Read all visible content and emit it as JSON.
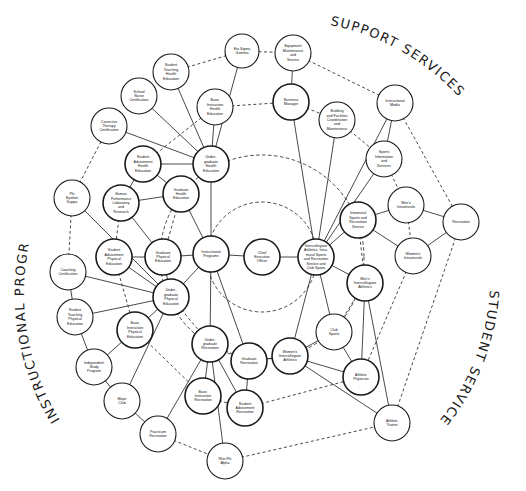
{
  "section_titles": {
    "support": "SUPPORT SERVICES",
    "instructional": "INSTRUCTIONAL PROGRAMS",
    "student": "STUDENT SERVICES"
  },
  "nodes": [
    {
      "id": "eta",
      "label": [
        "Eta Sigma",
        "Gamma"
      ],
      "x": 242,
      "y": 51,
      "r": 17
    },
    {
      "id": "equip",
      "label": [
        "Equipment",
        "Maintenance",
        "and",
        "Service"
      ],
      "x": 293,
      "y": 53,
      "r": 18
    },
    {
      "id": "stHealth",
      "label": [
        "Student",
        "Teaching",
        "Health",
        "Education"
      ],
      "x": 171,
      "y": 72,
      "r": 18
    },
    {
      "id": "nurse",
      "label": [
        "School",
        "Nurse",
        "Certification"
      ],
      "x": 139,
      "y": 96,
      "r": 18
    },
    {
      "id": "biHealth",
      "label": [
        "Basic",
        "Instruction",
        "Health",
        "Education"
      ],
      "x": 215,
      "y": 107,
      "r": 18
    },
    {
      "id": "business",
      "label": [
        "Business",
        "Manager"
      ],
      "x": 291,
      "y": 102,
      "r": 18,
      "bold": true
    },
    {
      "id": "building",
      "label": [
        "Building",
        "and Facilities",
        "Coordination",
        "and",
        "Maintenance"
      ],
      "x": 337,
      "y": 120,
      "r": 18
    },
    {
      "id": "media",
      "label": [
        "Instructional",
        "Media"
      ],
      "x": 395,
      "y": 103,
      "r": 18
    },
    {
      "id": "corrective",
      "label": [
        "Corrective",
        "Therapy",
        "Certification"
      ],
      "x": 109,
      "y": 126,
      "r": 18
    },
    {
      "id": "saHealth",
      "label": [
        "Student",
        "Advisement",
        "Health",
        "Education"
      ],
      "x": 143,
      "y": 164,
      "r": 18,
      "bold": true
    },
    {
      "id": "ugHealth",
      "label": [
        "Under-",
        "graduate",
        "Health",
        "Education"
      ],
      "x": 211,
      "y": 164,
      "r": 18,
      "bold": true
    },
    {
      "id": "sportsInfo",
      "label": [
        "Sports",
        "Information",
        "and",
        "Services"
      ],
      "x": 384,
      "y": 159,
      "r": 18
    },
    {
      "id": "gHealth",
      "label": [
        "Graduate",
        "Health",
        "Education"
      ],
      "x": 181,
      "y": 194,
      "r": 18,
      "bold": true
    },
    {
      "id": "hpl",
      "label": [
        "Human",
        "Performance",
        "Laboratory",
        "and",
        "Research"
      ],
      "x": 121,
      "y": 203,
      "r": 18,
      "bold": true
    },
    {
      "id": "phi",
      "label": [
        "Phi",
        "Epsilon",
        "Kappa"
      ],
      "x": 72,
      "y": 198,
      "r": 18
    },
    {
      "id": "mIntra",
      "label": [
        "Men's",
        "Intramurals"
      ],
      "x": 406,
      "y": 205,
      "r": 18
    },
    {
      "id": "recreation",
      "label": [
        "Recreation"
      ],
      "x": 461,
      "y": 222,
      "r": 18
    },
    {
      "id": "intramural",
      "label": [
        "Intramural",
        "Sports and",
        "Recreation",
        "Service"
      ],
      "x": 358,
      "y": 220,
      "r": 18,
      "bold": true
    },
    {
      "id": "saPE",
      "label": [
        "Student",
        "Advisement",
        "Physical",
        "Education"
      ],
      "x": 114,
      "y": 257,
      "r": 18,
      "bold": true
    },
    {
      "id": "gPE",
      "label": [
        "Graduate",
        "Physical",
        "Education"
      ],
      "x": 163,
      "y": 257,
      "r": 18,
      "bold": true
    },
    {
      "id": "instr",
      "label": [
        "Instructional",
        "Programs"
      ],
      "x": 211,
      "y": 254,
      "r": 18,
      "bold": true
    },
    {
      "id": "ceo",
      "label": [
        "Chief",
        "Executive",
        "Officer"
      ],
      "x": 262,
      "y": 257,
      "r": 18,
      "bold": true
    },
    {
      "id": "interAth",
      "label": [
        "Intercollegiate",
        "Athletics, Intra-",
        "mural Sports",
        "and Recreation",
        "Service and",
        "Club Sports"
      ],
      "x": 316,
      "y": 257,
      "r": 18,
      "bold": true
    },
    {
      "id": "wIntra",
      "label": [
        "Women's",
        "Intramurals"
      ],
      "x": 413,
      "y": 256,
      "r": 18
    },
    {
      "id": "coaching",
      "label": [
        "Coaching",
        "Certification"
      ],
      "x": 68,
      "y": 272,
      "r": 18
    },
    {
      "id": "ugPE",
      "label": [
        "Under-",
        "graduate",
        "Physical",
        "Education"
      ],
      "x": 171,
      "y": 297,
      "r": 18,
      "bold": true
    },
    {
      "id": "mInter",
      "label": [
        "Men's",
        "Intercollegiate",
        "Athletics"
      ],
      "x": 365,
      "y": 283,
      "r": 18,
      "bold": true
    },
    {
      "id": "stPE",
      "label": [
        "Student",
        "Teaching",
        "Physical",
        "Education"
      ],
      "x": 75,
      "y": 317,
      "r": 18
    },
    {
      "id": "biPE",
      "label": [
        "Basic",
        "Instruction",
        "Physical",
        "Education"
      ],
      "x": 135,
      "y": 330,
      "r": 18,
      "bold": true
    },
    {
      "id": "club",
      "label": [
        "Club",
        "Sports"
      ],
      "x": 334,
      "y": 332,
      "r": 18
    },
    {
      "id": "ugRec",
      "label": [
        "Under-",
        "graduate",
        "Recreation"
      ],
      "x": 210,
      "y": 344,
      "r": 18,
      "bold": true
    },
    {
      "id": "gRec",
      "label": [
        "Graduate",
        "Recreation"
      ],
      "x": 249,
      "y": 361,
      "r": 18,
      "bold": true
    },
    {
      "id": "wInter",
      "label": [
        "Women's",
        "Intercollegiate",
        "Athletics"
      ],
      "x": 290,
      "y": 356,
      "r": 18,
      "bold": true
    },
    {
      "id": "indep",
      "label": [
        "Independent",
        "Study",
        "Program"
      ],
      "x": 94,
      "y": 367,
      "r": 18
    },
    {
      "id": "physician",
      "label": [
        "Athletic",
        "Physician"
      ],
      "x": 361,
      "y": 377,
      "r": 18,
      "bold": true
    },
    {
      "id": "biRec",
      "label": [
        "Basic",
        "Instruction",
        "Recreation"
      ],
      "x": 203,
      "y": 396,
      "r": 18,
      "bold": true
    },
    {
      "id": "saRec",
      "label": [
        "Student",
        "Advisement",
        "Recreation"
      ],
      "x": 245,
      "y": 408,
      "r": 18,
      "bold": true
    },
    {
      "id": "major",
      "label": [
        "Major",
        "Club"
      ],
      "x": 122,
      "y": 401,
      "r": 18
    },
    {
      "id": "trainer",
      "label": [
        "Athletic",
        "Trainer"
      ],
      "x": 392,
      "y": 423,
      "r": 18
    },
    {
      "id": "practicum",
      "label": [
        "Practicum",
        "Recreation"
      ],
      "x": 158,
      "y": 434,
      "r": 18
    },
    {
      "id": "rho",
      "label": [
        "Rho Phi",
        "Alpha"
      ],
      "x": 225,
      "y": 461,
      "r": 18
    }
  ],
  "edges": [
    [
      "ceo",
      "instr",
      "solid"
    ],
    [
      "ceo",
      "interAth",
      "solid"
    ],
    [
      "instr",
      "ugHealth",
      "solid"
    ],
    [
      "instr",
      "gPE",
      "solid"
    ],
    [
      "instr",
      "ugPE",
      "solid"
    ],
    [
      "instr",
      "ugRec",
      "solid"
    ],
    [
      "instr",
      "gHealth",
      "solid"
    ],
    [
      "instr",
      "gRec",
      "solid"
    ],
    [
      "ugHealth",
      "eta",
      "solid"
    ],
    [
      "ugHealth",
      "stHealth",
      "solid"
    ],
    [
      "ugHealth",
      "nurse",
      "solid"
    ],
    [
      "ugHealth",
      "biHealth",
      "solid"
    ],
    [
      "ugHealth",
      "corrective",
      "solid"
    ],
    [
      "ugHealth",
      "saHealth",
      "solid"
    ],
    [
      "saHealth",
      "gHealth",
      "solid"
    ],
    [
      "saHealth",
      "hpl",
      "solid"
    ],
    [
      "gHealth",
      "hpl",
      "solid"
    ],
    [
      "hpl",
      "gPE",
      "solid"
    ],
    [
      "phi",
      "ugPE",
      "solid"
    ],
    [
      "saPE",
      "gPE",
      "solid"
    ],
    [
      "saPE",
      "ugPE",
      "solid"
    ],
    [
      "gPE",
      "ugPE",
      "solid"
    ],
    [
      "coaching",
      "ugPE",
      "solid"
    ],
    [
      "stPE",
      "ugPE",
      "solid"
    ],
    [
      "biPE",
      "ugPE",
      "solid"
    ],
    [
      "major",
      "ugPE",
      "solid"
    ],
    [
      "coaching",
      "stPE",
      "solid"
    ],
    [
      "stPE",
      "indep",
      "solid"
    ],
    [
      "indep",
      "biPE",
      "solid"
    ],
    [
      "indep",
      "major",
      "solid"
    ],
    [
      "major",
      "practicum",
      "solid"
    ],
    [
      "ugRec",
      "gRec",
      "dashed"
    ],
    [
      "ugRec",
      "biRec",
      "solid"
    ],
    [
      "ugRec",
      "saRec",
      "solid"
    ],
    [
      "ugRec",
      "practicum",
      "solid"
    ],
    [
      "ugRec",
      "rho",
      "solid"
    ],
    [
      "gRec",
      "saRec",
      "solid"
    ],
    [
      "equip",
      "business",
      "solid"
    ],
    [
      "business",
      "interAth",
      "solid"
    ],
    [
      "building",
      "interAth",
      "solid"
    ],
    [
      "media",
      "interAth",
      "solid"
    ],
    [
      "media",
      "sportsInfo",
      "solid"
    ],
    [
      "sportsInfo",
      "interAth",
      "solid"
    ],
    [
      "interAth",
      "intramural",
      "solid"
    ],
    [
      "interAth",
      "mInter",
      "solid"
    ],
    [
      "interAth",
      "wInter",
      "solid"
    ],
    [
      "interAth",
      "club",
      "solid"
    ],
    [
      "intramural",
      "mIntra",
      "solid"
    ],
    [
      "intramural",
      "wIntra",
      "solid"
    ],
    [
      "mIntra",
      "recreation",
      "solid"
    ],
    [
      "wIntra",
      "recreation",
      "solid"
    ],
    [
      "mInter",
      "physician",
      "solid"
    ],
    [
      "mInter",
      "trainer",
      "solid"
    ],
    [
      "wInter",
      "physician",
      "solid"
    ],
    [
      "wInter",
      "trainer",
      "solid"
    ],
    [
      "wInter",
      "club",
      "solid"
    ],
    [
      "club",
      "physician",
      "solid"
    ],
    [
      "gRec",
      "wInter",
      "solid"
    ],
    [
      "business",
      "building",
      "dashed"
    ],
    [
      "building",
      "sportsInfo",
      "dashed"
    ],
    [
      "sportsInfo",
      "mIntra",
      "dashed"
    ],
    [
      "mIntra",
      "wIntra",
      "dashed"
    ],
    [
      "intramural",
      "mInter",
      "dashed"
    ],
    [
      "club",
      "mInter",
      "dashed"
    ],
    [
      "eta",
      "equip",
      "dashed"
    ],
    [
      "biHealth",
      "business",
      "dashed"
    ],
    [
      "phi",
      "corrective",
      "dashed"
    ],
    [
      "phi",
      "coaching",
      "dashed"
    ],
    [
      "hpl",
      "saPE",
      "dashed"
    ],
    [
      "gHealth",
      "gPE",
      "dashed"
    ],
    [
      "saPE",
      "biPE",
      "dashed"
    ],
    [
      "biPE",
      "biRec",
      "dashed"
    ],
    [
      "ugPE",
      "ugRec",
      "dashed"
    ],
    [
      "practicum",
      "rho",
      "dashed"
    ],
    [
      "biRec",
      "saRec",
      "dashed"
    ],
    [
      "saRec",
      "physician",
      "dashed"
    ],
    [
      "rho",
      "trainer",
      "dashed"
    ],
    [
      "wIntra",
      "physician",
      "dashed"
    ],
    [
      "recreation",
      "trainer",
      "dashed"
    ],
    [
      "media",
      "recreation",
      "dashed"
    ],
    [
      "equip",
      "media",
      "dashed"
    ],
    [
      "stHealth",
      "eta",
      "dashed"
    ],
    [
      "saHealth",
      "biHealth",
      "dashed"
    ]
  ],
  "rings": [
    {
      "cx": 262,
      "cy": 257,
      "r": 55
    },
    {
      "cx": 262,
      "cy": 257,
      "r": 102
    }
  ],
  "colors": {
    "stroke": "#1a1a1a",
    "background": "#ffffff"
  }
}
